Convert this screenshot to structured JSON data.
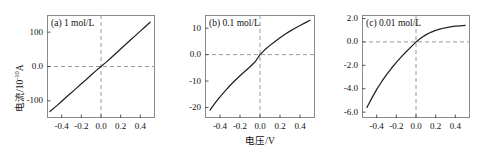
{
  "figure": {
    "xlabel": "电压/V",
    "ylabel_main": "电流/10",
    "ylabel_exp": "-10",
    "ylabel_unit": "A"
  },
  "chart_data": [
    {
      "type": "line",
      "title": "(a) 1 mol/L",
      "panel": "a",
      "xlabel": "电压/V",
      "ylabel": "电流/10^-10 A",
      "xlim": [
        -0.55,
        0.55
      ],
      "ylim": [
        -150,
        150
      ],
      "xticks": [
        "-0.4",
        "-0.2",
        "0.0",
        "0.2",
        "0.4"
      ],
      "xtickvals": [
        -0.4,
        -0.2,
        0.0,
        0.2,
        0.4
      ],
      "yticks": [
        "100",
        "0.0",
        "-100"
      ],
      "ytickvals": [
        100,
        0,
        -100
      ],
      "grid": false,
      "reference_lines": {
        "x": 0.0,
        "y": 0.0,
        "style": "dashed"
      },
      "x": [
        -0.52,
        -0.45,
        -0.4,
        -0.35,
        -0.3,
        -0.25,
        -0.2,
        -0.15,
        -0.1,
        -0.05,
        0.0,
        0.05,
        0.1,
        0.15,
        0.2,
        0.25,
        0.3,
        0.35,
        0.4,
        0.45,
        0.5
      ],
      "values": [
        -131,
        -114,
        -101,
        -88,
        -76,
        -63,
        -50,
        -38,
        -25,
        -12,
        0,
        12,
        25,
        38,
        51,
        64,
        77,
        90,
        103,
        116,
        129
      ]
    },
    {
      "type": "line",
      "title": "(b) 0.1 mol/L",
      "panel": "b",
      "xlabel": "电压/V",
      "ylabel": "电流/10^-10 A",
      "xlim": [
        -0.55,
        0.55
      ],
      "ylim": [
        -24,
        15
      ],
      "xticks": [
        "-0.4",
        "-0.2",
        "0.0",
        "0.2",
        "0.4"
      ],
      "xtickvals": [
        -0.4,
        -0.2,
        0.0,
        0.2,
        0.4
      ],
      "yticks": [
        "10",
        "0.0",
        "-10",
        "-20"
      ],
      "ytickvals": [
        10,
        0,
        -10,
        -20
      ],
      "grid": false,
      "reference_lines": {
        "x": 0.0,
        "y": 0.0,
        "style": "dashed"
      },
      "x": [
        -0.5,
        -0.45,
        -0.4,
        -0.35,
        -0.3,
        -0.25,
        -0.2,
        -0.15,
        -0.1,
        -0.05,
        0.0,
        0.05,
        0.1,
        0.15,
        0.2,
        0.25,
        0.3,
        0.35,
        0.4,
        0.45,
        0.5
      ],
      "values": [
        -21.0,
        -18.4,
        -16.0,
        -13.8,
        -11.7,
        -9.8,
        -8.0,
        -6.3,
        -4.6,
        -2.8,
        0.0,
        1.9,
        3.5,
        5.0,
        6.4,
        7.7,
        8.9,
        10.0,
        11.0,
        12.0,
        13.0
      ]
    },
    {
      "type": "line",
      "title": "(c) 0.01 mol/L",
      "panel": "c",
      "xlabel": "电压/V",
      "ylabel": "电流/10^-10 A",
      "xlim": [
        -0.55,
        0.55
      ],
      "ylim": [
        -6.5,
        2.3
      ],
      "xticks": [
        "-0.4",
        "-0.2",
        "0.0",
        "0.2",
        "0.4"
      ],
      "xtickvals": [
        -0.4,
        -0.2,
        0.0,
        0.2,
        0.4
      ],
      "yticks": [
        "2.0",
        "0.0",
        "-2.0",
        "-4.0",
        "-6.0"
      ],
      "ytickvals": [
        2.0,
        0.0,
        -2.0,
        -4.0,
        -6.0
      ],
      "grid": false,
      "reference_lines": {
        "x": 0.0,
        "y": 0.0,
        "style": "dashed"
      },
      "x": [
        -0.5,
        -0.45,
        -0.4,
        -0.35,
        -0.3,
        -0.25,
        -0.2,
        -0.15,
        -0.1,
        -0.05,
        0.0,
        0.05,
        0.1,
        0.15,
        0.2,
        0.25,
        0.3,
        0.35,
        0.4,
        0.45,
        0.5
      ],
      "values": [
        -5.6,
        -4.8,
        -4.05,
        -3.4,
        -2.8,
        -2.25,
        -1.75,
        -1.28,
        -0.84,
        -0.42,
        0.0,
        0.33,
        0.6,
        0.82,
        0.99,
        1.11,
        1.21,
        1.28,
        1.34,
        1.38,
        1.42
      ]
    }
  ]
}
